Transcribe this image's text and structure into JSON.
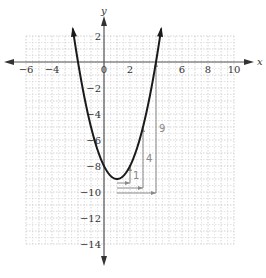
{
  "chart_data": {
    "type": "line",
    "title": "",
    "function": "y = x^2 - 2x - 8",
    "xlabel": "x",
    "ylabel": "y",
    "xlim": [
      -6,
      10
    ],
    "ylim": [
      -14,
      2
    ],
    "grid": true,
    "x_ticks": [
      "-6",
      "-4",
      "0",
      "2",
      "6",
      "8",
      "10"
    ],
    "y_ticks": [
      "2",
      "-2",
      "-4",
      "-6",
      "-8",
      "-10",
      "-12",
      "-14"
    ],
    "vertex": [
      1,
      -9
    ],
    "x_intercepts": [
      -2,
      4
    ],
    "points": [
      [
        -2.4,
        2.56
      ],
      [
        -2,
        0
      ],
      [
        -1,
        -5
      ],
      [
        0,
        -8
      ],
      [
        1,
        -9
      ],
      [
        2,
        -8
      ],
      [
        3,
        -5
      ],
      [
        4,
        0
      ],
      [
        4.4,
        2.56
      ]
    ],
    "step_annotations": [
      {
        "run": 1,
        "rise": 1,
        "label": "1"
      },
      {
        "run": 2,
        "rise": 4,
        "label": "4"
      },
      {
        "run": 3,
        "rise": 9,
        "label": "9"
      }
    ],
    "colors": {
      "curve": "#1a1a1a",
      "axes": "#555555",
      "grid": "#c8c8c8",
      "annotations": "#8a8a8a"
    }
  },
  "axes": {
    "x_label": "x",
    "y_label": "y"
  },
  "ticks": {
    "x": [
      {
        "v": -6,
        "t": "-6"
      },
      {
        "v": -4,
        "t": "-4"
      },
      {
        "v": 0,
        "t": "0"
      },
      {
        "v": 2,
        "t": "2"
      },
      {
        "v": 6,
        "t": "6"
      },
      {
        "v": 8,
        "t": "8"
      },
      {
        "v": 10,
        "t": "10"
      }
    ],
    "y": [
      {
        "v": 2,
        "t": "2"
      },
      {
        "v": -2,
        "t": "−2"
      },
      {
        "v": -4,
        "t": "−4"
      },
      {
        "v": -6,
        "t": "−6"
      },
      {
        "v": -8,
        "t": "−8"
      },
      {
        "v": -10,
        "t": "−10"
      },
      {
        "v": -12,
        "t": "−12"
      },
      {
        "v": -14,
        "t": "−14"
      }
    ]
  },
  "annotations": {
    "one": "1",
    "four": "4",
    "nine": "9"
  }
}
